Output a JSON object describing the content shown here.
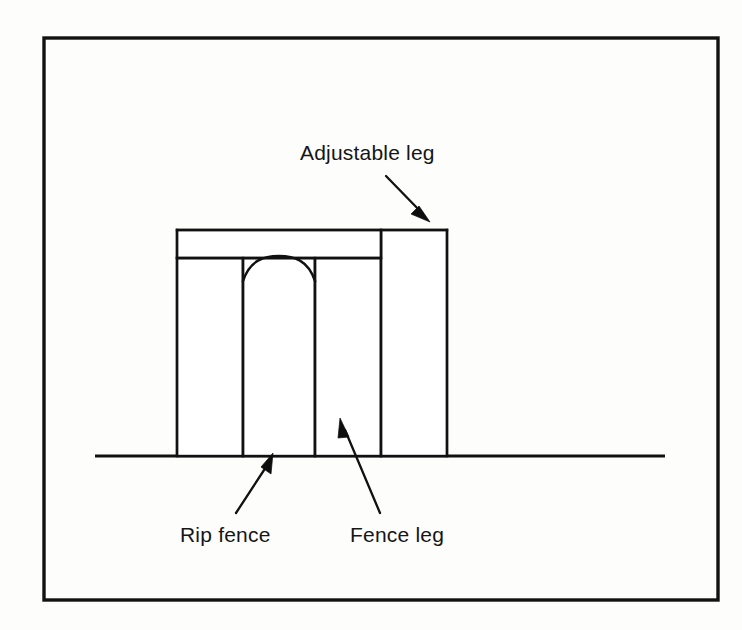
{
  "figure": {
    "kind": "technical-line-drawing",
    "background_color": "#fdfdfc",
    "ink_color": "#111111",
    "border": {
      "x": 44,
      "y": 38,
      "width": 674,
      "height": 562,
      "stroke_width": 3.4
    }
  },
  "labels": {
    "adjustable_leg": "Adjustable leg",
    "rip_fence": "Rip fence",
    "fence_leg": "Fence leg"
  },
  "callouts": [
    {
      "id": "adjustable-leg",
      "label": "Adjustable leg",
      "text_x": 300,
      "text_y": 160,
      "leader": {
        "x1": 386,
        "y1": 176,
        "x2": 428,
        "y2": 219
      },
      "arrow_angle_deg": 45
    },
    {
      "id": "rip-fence",
      "label": "Rip fence",
      "text_x": 180,
      "text_y": 542,
      "leader": {
        "x1": 236,
        "y1": 513,
        "x2": 272,
        "y2": 457
      },
      "arrow_angle_deg": -57
    },
    {
      "id": "fence-leg",
      "label": "Fence leg",
      "text_x": 350,
      "text_y": 542,
      "leader": {
        "x1": 380,
        "y1": 513,
        "x2": 342,
        "y2": 421
      },
      "arrow_angle_deg": -68
    }
  ],
  "geometry": {
    "ground": {
      "x1": 95,
      "y1": 456,
      "x2": 665,
      "y2": 456
    },
    "top_bar": {
      "x": 177,
      "y": 230,
      "width": 270,
      "height": 28
    },
    "top_bar_divider_x": 381,
    "adjustable_leg_block": {
      "x": 381,
      "y": 230,
      "width": 66,
      "height": 226
    },
    "legs": [
      {
        "name": "left-outer-leg",
        "x": 177,
        "y": 258,
        "width": 66,
        "height": 198
      },
      {
        "name": "rip-fence-panel",
        "x": 243,
        "y": 258,
        "width": 72,
        "height": 198
      },
      {
        "name": "fence-leg",
        "x": 315,
        "y": 258,
        "width": 66,
        "height": 198
      }
    ],
    "arch": {
      "left_x": 243,
      "right_x": 315,
      "base_y": 281,
      "apex_y": 257,
      "description": "shallow arch cut at the top of the rip fence panel"
    },
    "vertical_rail_xs": [
      177,
      243,
      315,
      381,
      447
    ]
  }
}
